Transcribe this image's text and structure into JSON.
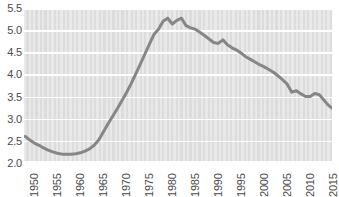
{
  "chart_data": {
    "type": "line",
    "title": "",
    "subtitle": "",
    "xlabel": "",
    "ylabel": "",
    "xlim": [
      1950,
      2017
    ],
    "ylim": [
      2.0,
      5.5
    ],
    "grid": true,
    "legend": null,
    "line_color": "#868686",
    "plot_background": "#dcdcdc",
    "stripe_color": "#e9e9e9",
    "gridline_color": "#ffffff",
    "tick_label_color": "#4a4a4a",
    "y_ticks": [
      "2.0",
      "2.5",
      "3.0",
      "3.5",
      "4.0",
      "4.5",
      "5.0",
      "5.5"
    ],
    "y_tick_values": [
      2.0,
      2.5,
      3.0,
      3.5,
      4.0,
      4.5,
      5.0,
      5.5
    ],
    "x_ticks": [
      "1950",
      "1955",
      "1960",
      "1965",
      "1970",
      "1975",
      "1980",
      "1985",
      "1990",
      "1995",
      "2000",
      "2005",
      "2010",
      "2015"
    ],
    "x_tick_values": [
      1950,
      1955,
      1960,
      1965,
      1970,
      1975,
      1980,
      1985,
      1990,
      1995,
      2000,
      2005,
      2010,
      2015
    ],
    "x": [
      1950,
      1951,
      1952,
      1953,
      1954,
      1955,
      1956,
      1957,
      1958,
      1959,
      1960,
      1961,
      1962,
      1963,
      1964,
      1965,
      1966,
      1967,
      1968,
      1969,
      1970,
      1971,
      1972,
      1973,
      1974,
      1975,
      1976,
      1977,
      1978,
      1979,
      1980,
      1981,
      1982,
      1983,
      1984,
      1985,
      1986,
      1987,
      1988,
      1989,
      1990,
      1991,
      1992,
      1993,
      1994,
      1995,
      1996,
      1997,
      1998,
      1999,
      2000,
      2001,
      2002,
      2003,
      2004,
      2005,
      2006,
      2007,
      2008,
      2009,
      2010,
      2011,
      2012,
      2013,
      2014,
      2015,
      2016,
      2017
    ],
    "y": [
      2.6,
      2.52,
      2.45,
      2.4,
      2.34,
      2.29,
      2.25,
      2.22,
      2.2,
      2.2,
      2.2,
      2.21,
      2.23,
      2.27,
      2.32,
      2.4,
      2.52,
      2.7,
      2.88,
      3.05,
      3.22,
      3.4,
      3.58,
      3.78,
      4.0,
      4.22,
      4.45,
      4.68,
      4.9,
      5.02,
      5.2,
      5.27,
      5.14,
      5.22,
      5.27,
      5.1,
      5.05,
      5.02,
      4.95,
      4.88,
      4.8,
      4.72,
      4.7,
      4.78,
      4.67,
      4.6,
      4.55,
      4.48,
      4.4,
      4.34,
      4.28,
      4.22,
      4.17,
      4.11,
      4.05,
      3.97,
      3.88,
      3.78,
      3.6,
      3.63,
      3.56,
      3.5,
      3.5,
      3.57,
      3.54,
      3.42,
      3.3,
      3.22,
      3.2,
      3.2
    ],
    "series": [
      {
        "name": "",
        "values": [
          2.6,
          2.52,
          2.45,
          2.4,
          2.34,
          2.29,
          2.25,
          2.22,
          2.2,
          2.2,
          2.2,
          2.21,
          2.23,
          2.27,
          2.32,
          2.4,
          2.52,
          2.7,
          2.88,
          3.05,
          3.22,
          3.4,
          3.58,
          3.78,
          4.0,
          4.22,
          4.45,
          4.68,
          4.9,
          5.02,
          5.2,
          5.27,
          5.14,
          5.22,
          5.27,
          5.1,
          5.05,
          5.02,
          4.95,
          4.88,
          4.8,
          4.72,
          4.7,
          4.78,
          4.67,
          4.6,
          4.55,
          4.48,
          4.4,
          4.34,
          4.28,
          4.22,
          4.17,
          4.11,
          4.05,
          3.97,
          3.88,
          3.78,
          3.6,
          3.63,
          3.56,
          3.5,
          3.5,
          3.57,
          3.54,
          3.42,
          3.3,
          3.22
        ]
      }
    ]
  }
}
